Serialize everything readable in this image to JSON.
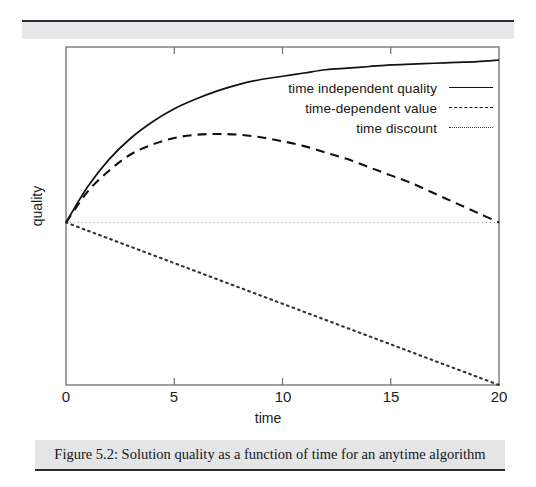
{
  "figure": {
    "caption": "Figure 5.2: Solution quality as a function of time for an anytime algorithm"
  },
  "chart_data": {
    "type": "line",
    "title": "",
    "xlabel": "time",
    "ylabel": "quality",
    "xlim": [
      0,
      20
    ],
    "ylim": [
      -1.0,
      1.08
    ],
    "xticks": [
      0,
      5,
      10,
      15,
      20
    ],
    "xticklabels": [
      "0",
      "5",
      "10",
      "15",
      "20"
    ],
    "yticks": [],
    "yticklabels": [],
    "grid": false,
    "legend_position": "upper-right-inside",
    "baseline": {
      "name": "zero-baseline",
      "style": "dotted",
      "y": 0.0,
      "color": "#9a9a9a"
    },
    "x": [
      0,
      1,
      2,
      3,
      4,
      5,
      6,
      7,
      8,
      9,
      10,
      11,
      12,
      13,
      14,
      15,
      16,
      17,
      18,
      19,
      20
    ],
    "series": [
      {
        "name": "time independent quality",
        "style": "solid",
        "color": "#111111",
        "values": [
          0.0,
          0.22,
          0.39,
          0.52,
          0.62,
          0.7,
          0.76,
          0.81,
          0.85,
          0.88,
          0.9,
          0.92,
          0.94,
          0.95,
          0.96,
          0.97,
          0.975,
          0.98,
          0.985,
          0.99,
          1.0
        ]
      },
      {
        "name": "time-dependent value",
        "style": "dashed",
        "color": "#111111",
        "values": [
          0.0,
          0.19,
          0.32,
          0.42,
          0.48,
          0.52,
          0.54,
          0.545,
          0.54,
          0.525,
          0.5,
          0.47,
          0.43,
          0.39,
          0.34,
          0.29,
          0.24,
          0.18,
          0.12,
          0.06,
          0.0
        ]
      },
      {
        "name": "time discount",
        "style": "dotted",
        "color": "#333333",
        "values": [
          0.0,
          -0.05,
          -0.1,
          -0.15,
          -0.2,
          -0.25,
          -0.3,
          -0.35,
          -0.4,
          -0.45,
          -0.5,
          -0.55,
          -0.6,
          -0.65,
          -0.7,
          -0.75,
          -0.8,
          -0.85,
          -0.9,
          -0.95,
          -1.0
        ]
      }
    ]
  },
  "legend": {
    "items": [
      {
        "label": "time independent quality",
        "style": "solid"
      },
      {
        "label": "time-dependent value",
        "style": "dashed"
      },
      {
        "label": "time discount",
        "style": "dotted"
      }
    ]
  }
}
